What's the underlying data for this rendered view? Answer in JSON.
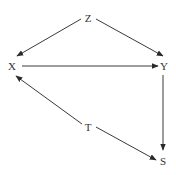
{
  "diagram": {
    "type": "causal-dag",
    "colors": {
      "background": "#ffffff",
      "edge": "#3a3a3a",
      "label": "#333333"
    },
    "nodes": [
      {
        "id": "Z",
        "label": "Z",
        "x": 88,
        "y": 18
      },
      {
        "id": "X",
        "label": "X",
        "x": 12,
        "y": 66
      },
      {
        "id": "Y",
        "label": "Y",
        "x": 163,
        "y": 66
      },
      {
        "id": "T",
        "label": "T",
        "x": 88,
        "y": 127
      },
      {
        "id": "S",
        "label": "S",
        "x": 162,
        "y": 161
      }
    ],
    "edges": [
      {
        "from": "Z",
        "to": "X"
      },
      {
        "from": "Z",
        "to": "Y"
      },
      {
        "from": "X",
        "to": "Y"
      },
      {
        "from": "Y",
        "to": "S"
      },
      {
        "from": "T",
        "to": "X"
      },
      {
        "from": "T",
        "to": "S"
      }
    ]
  }
}
